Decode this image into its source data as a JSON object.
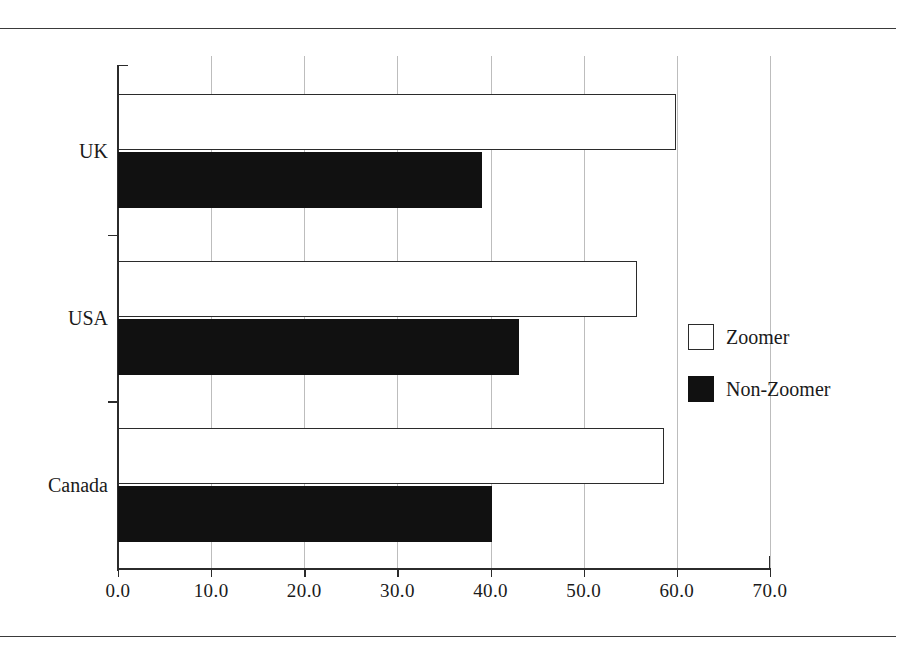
{
  "figure": {
    "rules": {
      "top_label": "page-rule-top",
      "bottom_label": "page-rule-bottom"
    }
  },
  "chart_data": {
    "type": "bar",
    "orientation": "horizontal",
    "title": "",
    "subtitle": "",
    "xlabel": "",
    "ylabel": "",
    "categories": [
      "UK",
      "USA",
      "Canada"
    ],
    "series": [
      {
        "name": "Zoomer",
        "color": "#ffffff",
        "edge_color": "#2b2b2b",
        "values": [
          59.9,
          55.7,
          58.6
        ]
      },
      {
        "name": "Non-Zoomer",
        "color": "#111111",
        "edge_color": "#111111",
        "values": [
          39.1,
          43.0,
          40.2
        ]
      }
    ],
    "xlim": [
      0,
      70
    ],
    "ylim": [
      0,
      3
    ],
    "xticks": [
      0,
      10,
      20,
      30,
      40,
      50,
      60,
      70
    ],
    "xticklabels": [
      "0.0",
      "10.0",
      "20.0",
      "30.0",
      "40.0",
      "50.0",
      "60.0",
      "70.0"
    ],
    "grid": {
      "x": true,
      "y": false
    },
    "legend": {
      "position": "right",
      "entries": [
        {
          "label": "Zoomer",
          "swatch": "open-square-swatch"
        },
        {
          "label": "Non-Zoomer",
          "swatch": "filled-square-swatch"
        }
      ]
    }
  }
}
